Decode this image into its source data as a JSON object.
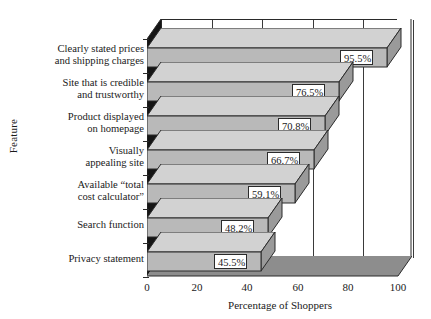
{
  "chart_data": {
    "type": "bar",
    "orientation": "horizontal",
    "title": "",
    "xlabel": "Percentage of Shoppers",
    "ylabel": "Feature",
    "xlim": [
      0,
      100
    ],
    "xticks": [
      0,
      20,
      40,
      60,
      80,
      100
    ],
    "xtick_labels": [
      "0",
      "20",
      "40",
      "60",
      "80",
      "100"
    ],
    "grid": true,
    "legend": false,
    "style": "3d-horizontal-bars",
    "categories": [
      "Clearly stated prices and shipping charges",
      "Site that is credible and trustworthy",
      "Product displayed on homepage",
      "Visually appealing site",
      "Available “total cost calculator”",
      "Search function",
      "Privacy statement"
    ],
    "values": [
      95.5,
      76.5,
      70.8,
      66.7,
      59.1,
      48.2,
      45.5
    ],
    "data_labels": [
      "95.5%",
      "76.5%",
      "70.8%",
      "66.7%",
      "59.1%",
      "48.2%",
      "45.5%"
    ],
    "colors": {
      "bar_face": "#b9b9b9",
      "bar_top": "#d2d2d2",
      "bar_side": "#9a9a9a",
      "wall_dark": "#151515",
      "floor": "#8d8d8d",
      "outline": "#2b2b2b",
      "background": "#ffffff",
      "label_box": "#ffffff"
    }
  },
  "axes": {
    "y_title": "Feature",
    "x_title": "Percentage of Shoppers",
    "category_lines": [
      [
        "Clearly stated prices",
        "and shipping charges"
      ],
      [
        "Site that is credible",
        "and trustworthy"
      ],
      [
        "Product displayed",
        "on homepage"
      ],
      [
        "Visually",
        "appealing site"
      ],
      [
        "Available “total",
        "cost calculator”"
      ],
      [
        "Search function"
      ],
      [
        "Privacy statement"
      ]
    ]
  }
}
